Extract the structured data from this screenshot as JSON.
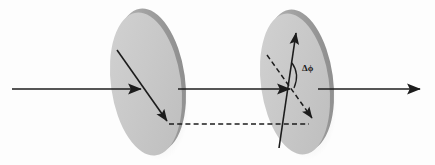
{
  "figure": {
    "background_color": "#fdfdfd",
    "stroke_color": "#1c1c1c",
    "disc_fill": "#c8c8c8",
    "disc_rim_dark": "#9a9a9a",
    "disc_shadow": "#b5b5b5"
  },
  "annotations": {
    "phase_label": "Δϕ"
  },
  "elements": {
    "disc_one_name": "first-birefringent-disc",
    "disc_two_name": "second-birefringent-disc",
    "beam_in_name": "incoming-beam",
    "beam_mid_name": "intermediate-beam",
    "beam_out_name": "outgoing-beam",
    "disc_one_axis_name": "disc-one-polarization-axis-arrow",
    "disc_two_fast_axis_name": "disc-two-fast-axis-arrow",
    "disc_two_slow_axis_name": "disc-two-slow-axis-dashed-arrow",
    "projection_name": "projection-dashed-line",
    "angle_arc_name": "phase-angle-arc"
  },
  "geometry": {
    "canvas": {
      "width": 435,
      "height": 165
    },
    "disc_one": {
      "cx": 147,
      "cy": 83,
      "rx": 35,
      "ry": 72,
      "rotation": -8
    },
    "disc_two": {
      "cx": 296,
      "cy": 83,
      "rx": 34,
      "ry": 71,
      "rotation": -8
    },
    "beam_in": {
      "x1": 12,
      "y1": 89,
      "x2": 143,
      "y2": 89
    },
    "beam_mid": {
      "x1": 178,
      "y1": 89,
      "x2": 292,
      "y2": 89
    },
    "beam_out": {
      "x1": 318,
      "y1": 89,
      "x2": 422,
      "y2": 89
    },
    "disc_one_axis": {
      "x1": 117,
      "y1": 50,
      "x2": 168,
      "y2": 122
    },
    "disc_two_fast_axis": {
      "x1": 278,
      "y1": 147,
      "x2": 296,
      "y2": 30
    },
    "disc_two_slow_axis": {
      "x1": 267,
      "y1": 55,
      "x2": 314,
      "y2": 120
    },
    "projection_line": {
      "x1": 166,
      "y1": 124,
      "x2": 311,
      "y2": 124
    }
  }
}
